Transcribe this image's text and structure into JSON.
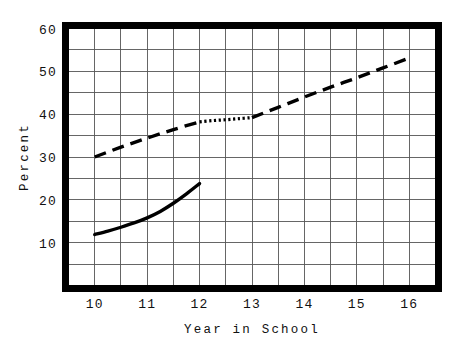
{
  "chart_data": {
    "type": "line",
    "title": "",
    "xlabel": "Year in School",
    "ylabel": "Percent",
    "xlim": [
      9.5,
      16.5
    ],
    "ylim": [
      0,
      60
    ],
    "grid": true,
    "legend": "none",
    "x_ticks": [
      10,
      11,
      12,
      13,
      14,
      15,
      16
    ],
    "x_tick_labels": [
      "10",
      "11",
      "12",
      "13",
      "14",
      "15",
      "16"
    ],
    "y_ticks": [
      10,
      20,
      30,
      40,
      50,
      60
    ],
    "y_tick_labels": [
      "10",
      "20",
      "30",
      "40",
      "50",
      "60"
    ],
    "x_gridlines": [
      10,
      10.5,
      11,
      11.5,
      12,
      12.5,
      13,
      13.5,
      14,
      14.5,
      15,
      15.5,
      16
    ],
    "y_gridlines": [
      5,
      10,
      15,
      20,
      25,
      30,
      35,
      40,
      45,
      50,
      55
    ],
    "series": [
      {
        "name": "upper-dashed-segment-1",
        "style": "dashed",
        "x": [
          10,
          10.5,
          11,
          11.5,
          12
        ],
        "values": [
          30.0,
          32.3,
          34.4,
          36.4,
          38.2
        ]
      },
      {
        "name": "upper-dotted-segment",
        "style": "dotted",
        "x": [
          12,
          12.25,
          12.5,
          12.75,
          13
        ],
        "values": [
          38.2,
          38.5,
          38.7,
          38.95,
          39.2
        ]
      },
      {
        "name": "upper-dashed-segment-2",
        "style": "dashed",
        "x": [
          13,
          13.5,
          14,
          14.5,
          15,
          15.5,
          16
        ],
        "values": [
          39.2,
          41.6,
          44.0,
          46.3,
          48.5,
          50.8,
          53.1
        ]
      },
      {
        "name": "lower-solid",
        "style": "solid",
        "x": [
          10,
          10.25,
          10.5,
          10.75,
          11,
          11.25,
          11.5,
          11.75,
          12
        ],
        "values": [
          11.9,
          12.7,
          13.6,
          14.6,
          15.8,
          17.3,
          19.2,
          21.4,
          23.8
        ]
      }
    ]
  },
  "axes": {
    "y_title": "Percent",
    "x_title": "Year in School"
  }
}
